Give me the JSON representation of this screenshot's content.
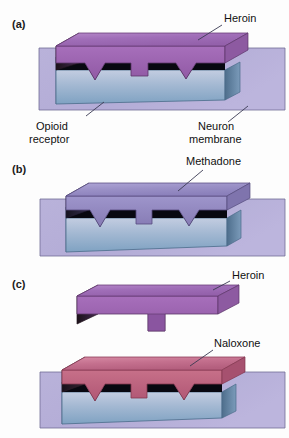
{
  "figure": {
    "background_color": "#fdfdfd"
  },
  "panels": [
    {
      "id": "a",
      "label": "(a)",
      "callouts": [
        {
          "name": "heroin",
          "text": "Heroin"
        },
        {
          "name": "opioid-receptor",
          "text": "Opioid",
          "text2": "receptor"
        },
        {
          "name": "neuron-membrane",
          "text": "Neuron",
          "text2": "membrane"
        }
      ]
    },
    {
      "id": "b",
      "label": "(b)",
      "callouts": [
        {
          "name": "methadone",
          "text": "Methadone"
        }
      ]
    },
    {
      "id": "c",
      "label": "(c)",
      "callouts": [
        {
          "name": "heroin",
          "text": "Heroin"
        },
        {
          "name": "naloxone",
          "text": "Naloxone"
        }
      ]
    }
  ],
  "labels": {
    "panel_a": "(a)",
    "panel_b": "(b)",
    "panel_c": "(c)",
    "heroin_a": "Heroin",
    "opioid_receptor_line1": "Opioid",
    "opioid_receptor_line2": "receptor",
    "neuron_membrane_line1": "Neuron",
    "neuron_membrane_line2": "membrane",
    "methadone": "Methadone",
    "heroin_c": "Heroin",
    "naloxone": "Naloxone"
  },
  "colors": {
    "heroin_top": "#a070b8",
    "heroin_top_light": "#c49ad4",
    "heroin_front": "#9a62ae",
    "heroin_side_dark": "#3a2440",
    "methadone_top": "#9c92c8",
    "methadone_top_light": "#b7aedc",
    "methadone_front": "#8d82bd",
    "naloxone_top": "#c06890",
    "naloxone_top_light": "#d3889f",
    "naloxone_front": "#b85c7e",
    "receptor_top": "#a8b8d4",
    "receptor_front_top": "#bcc6dd",
    "receptor_front_bottom": "#7fa0c0",
    "receptor_side": "#5e7e9c",
    "receptor_dark_edge": "#0b0b12",
    "membrane_slab": "#b3abd6",
    "membrane_slab_stroke": "#6b6590",
    "leader_line": "#3a3a52",
    "text": "#111111"
  }
}
